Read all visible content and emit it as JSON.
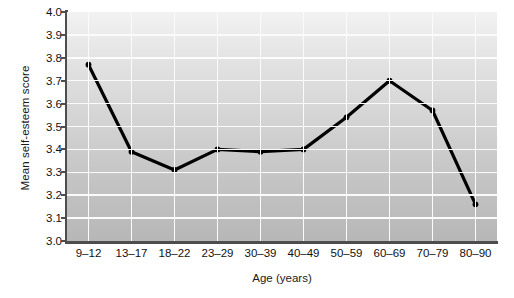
{
  "chart_data": {
    "type": "line",
    "title": "",
    "xlabel": "Age (years)",
    "ylabel": "Mean self-esteem score",
    "categories": [
      "9–12",
      "13–17",
      "18–22",
      "23–29",
      "30–39",
      "40–49",
      "50–59",
      "60–69",
      "70–79",
      "80–90"
    ],
    "values": [
      3.77,
      3.39,
      3.31,
      3.4,
      3.39,
      3.4,
      3.54,
      3.7,
      3.57,
      3.16
    ],
    "series": [
      {
        "name": "Mean self-esteem score",
        "values": [
          3.77,
          3.39,
          3.31,
          3.4,
          3.39,
          3.4,
          3.54,
          3.7,
          3.57,
          3.16
        ]
      }
    ],
    "ylim": [
      3.0,
      4.0
    ],
    "ytick_labels": [
      "4.0",
      "3.9",
      "3.8",
      "3.7",
      "3.6",
      "3.5",
      "3.4",
      "3.3",
      "3.2",
      "3.1",
      "3.0"
    ],
    "ytick_values": [
      4.0,
      3.9,
      3.8,
      3.7,
      3.6,
      3.5,
      3.4,
      3.3,
      3.2,
      3.1,
      3.0
    ],
    "grid": true,
    "grid_color": "#fbfbfb",
    "legend": "none",
    "line_color": "#000000",
    "marker": "circle",
    "marker_color": "#000000",
    "plot_background": "#cfcfcf",
    "axis_color": "#4d4d4d",
    "text_color": "#111111"
  }
}
